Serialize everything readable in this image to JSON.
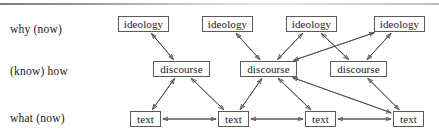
{
  "diagram": {
    "top_rule": "horizontal-rule",
    "row_labels": [
      {
        "id": "why",
        "text": "why (now)"
      },
      {
        "id": "how",
        "text": "(know) how"
      },
      {
        "id": "what",
        "text": "what (now)"
      }
    ],
    "tiers": [
      {
        "id": "ideology",
        "label_ref": "why (now)",
        "nodes": [
          {
            "id": "ideology-1",
            "label": "ideology",
            "x": 118,
            "y": 16
          },
          {
            "id": "ideology-2",
            "label": "ideology",
            "x": 202,
            "y": 16
          },
          {
            "id": "ideology-3",
            "label": "ideology",
            "x": 286,
            "y": 16
          },
          {
            "id": "ideology-4",
            "label": "ideology",
            "x": 374,
            "y": 16
          }
        ]
      },
      {
        "id": "discourse",
        "label_ref": "(know) how",
        "nodes": [
          {
            "id": "discourse-1",
            "label": "discourse",
            "x": 153,
            "y": 61
          },
          {
            "id": "discourse-2",
            "label": "discourse",
            "x": 240,
            "y": 61
          },
          {
            "id": "discourse-3",
            "label": "discourse",
            "x": 330,
            "y": 61
          }
        ]
      },
      {
        "id": "text",
        "label_ref": "what (now)",
        "nodes": [
          {
            "id": "text-1",
            "label": "text",
            "x": 130,
            "y": 111
          },
          {
            "id": "text-2",
            "label": "text",
            "x": 218,
            "y": 111
          },
          {
            "id": "text-3",
            "label": "text",
            "x": 305,
            "y": 111
          },
          {
            "id": "text-4",
            "label": "text",
            "x": 393,
            "y": 111
          }
        ]
      }
    ],
    "edges": [
      {
        "from": "ideology-1",
        "to": "discourse-1",
        "arrows": "both"
      },
      {
        "from": "ideology-2",
        "to": "discourse-2",
        "arrows": "both"
      },
      {
        "from": "ideology-3",
        "to": "discourse-2",
        "arrows": "both"
      },
      {
        "from": "ideology-3",
        "to": "discourse-3",
        "arrows": "both"
      },
      {
        "from": "ideology-4",
        "to": "discourse-3",
        "arrows": "both"
      },
      {
        "from": "ideology-4",
        "to": "discourse-2",
        "arrows": "both"
      },
      {
        "from": "discourse-1",
        "to": "text-1",
        "arrows": "both"
      },
      {
        "from": "discourse-1",
        "to": "text-2",
        "arrows": "both"
      },
      {
        "from": "discourse-2",
        "to": "text-2",
        "arrows": "both"
      },
      {
        "from": "discourse-2",
        "to": "text-3",
        "arrows": "both"
      },
      {
        "from": "discourse-2",
        "to": "text-4",
        "arrows": "both"
      },
      {
        "from": "discourse-3",
        "to": "text-4",
        "arrows": "both"
      },
      {
        "from": "text-1",
        "to": "text-2",
        "arrows": "both"
      },
      {
        "from": "text-2",
        "to": "text-3",
        "arrows": "both"
      },
      {
        "from": "text-3",
        "to": "text-4",
        "arrows": "both"
      }
    ],
    "colors": {
      "box_border": "#5a5a5a",
      "edge": "#4a4a4a",
      "text": "#1a1a1a",
      "background": "#ffffff"
    }
  }
}
